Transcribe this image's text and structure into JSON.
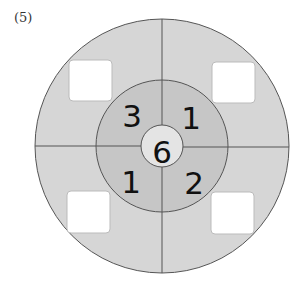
{
  "problem": {
    "label": "(5)"
  },
  "diagram": {
    "center": [
      162,
      146
    ],
    "outer_radius": 127,
    "middle_radius": 66,
    "inner_radius": 21,
    "colors": {
      "outer_ring": "#d6d6d6",
      "middle_ring": "#c6c6c6",
      "inner_circle": "#e4e4e4",
      "lines": "#555555",
      "answer_box": "#ffffff"
    },
    "center_value": "6",
    "middle_values": {
      "top_left": "3",
      "top_right": "1",
      "bottom_left": "1",
      "bottom_right": "2"
    },
    "answer_boxes": {
      "top_left": "",
      "top_right": "",
      "bottom_left": "",
      "bottom_right": ""
    }
  }
}
